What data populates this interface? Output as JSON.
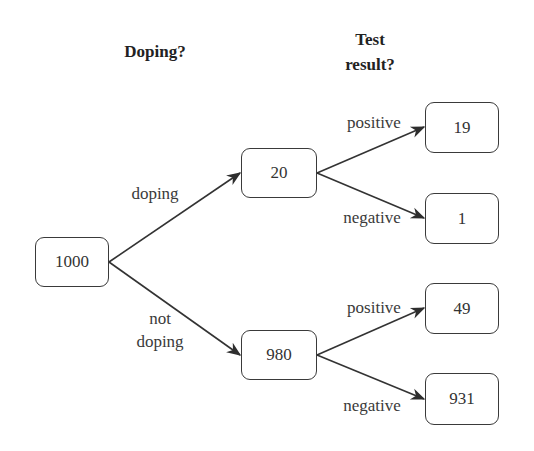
{
  "diagram": {
    "type": "probability-tree",
    "headings": {
      "level1": "Doping?",
      "level2_line1": "Test",
      "level2_line2": "result?"
    },
    "nodes": {
      "root": "1000",
      "doping": "20",
      "not_doping": "980",
      "doping_positive": "19",
      "doping_negative": "1",
      "not_doping_positive": "49",
      "not_doping_negative": "931"
    },
    "edge_labels": {
      "doping": "doping",
      "not_doping_line1": "not",
      "not_doping_line2": "doping",
      "doping_positive": "positive",
      "doping_negative": "negative",
      "not_doping_positive": "positive",
      "not_doping_negative": "negative"
    },
    "colors": {
      "line": "#333333",
      "border": "#3a3a3a",
      "text": "#333333"
    }
  }
}
